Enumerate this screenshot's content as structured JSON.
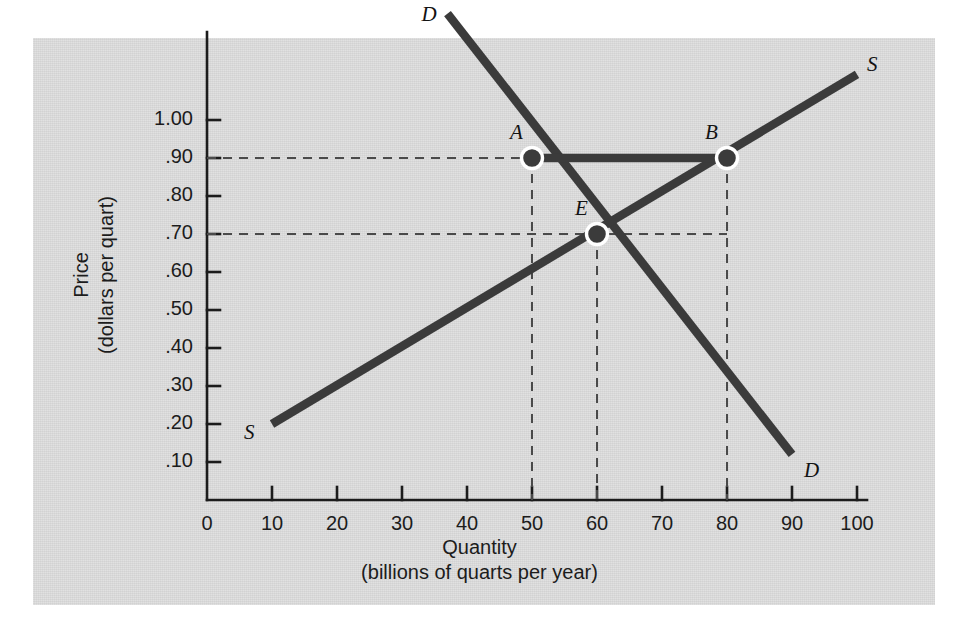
{
  "chart_data": {
    "type": "line",
    "title": "",
    "xlabel": "Quantity\n(billions of quarts per year)",
    "xlabel_main": "Quantity",
    "xlabel_sub": "(billions of quarts per year)",
    "ylabel": "Price\n(dollars per quart)",
    "ylabel_main": "Price",
    "ylabel_sub": "(dollars per quart)",
    "xlim": [
      0,
      100
    ],
    "ylim": [
      0,
      1.2
    ],
    "grid": false,
    "legend": "none",
    "x_ticks": [
      "0",
      "10",
      "20",
      "30",
      "40",
      "50",
      "60",
      "70",
      "80",
      "90",
      "100"
    ],
    "x_tick_values": [
      0,
      10,
      20,
      30,
      40,
      50,
      60,
      70,
      80,
      90,
      100
    ],
    "y_ticks": [
      ".10",
      ".20",
      ".30",
      ".40",
      ".50",
      ".60",
      ".70",
      ".80",
      ".90",
      "1.00"
    ],
    "y_tick_values": [
      0.1,
      0.2,
      0.3,
      0.4,
      0.5,
      0.6,
      0.7,
      0.8,
      0.9,
      1.0
    ],
    "series": [
      {
        "name": "Demand",
        "label": "D",
        "label_start": "D",
        "label_end": "D",
        "points": [
          [
            37,
            1.28
          ],
          [
            90,
            0.12
          ]
        ],
        "color": "#3b3b3b"
      },
      {
        "name": "Supply",
        "label": "S",
        "label_start": "S",
        "label_end": "S",
        "points": [
          [
            10,
            0.2
          ],
          [
            100,
            1.12
          ]
        ],
        "color": "#3b3b3b"
      }
    ],
    "annotated_points": [
      {
        "label": "A",
        "x": 50,
        "y": 0.9,
        "note": "quantity demanded at price .90"
      },
      {
        "label": "E",
        "x": 60,
        "y": 0.7,
        "note": "equilibrium"
      },
      {
        "label": "B",
        "x": 80,
        "y": 0.9,
        "note": "quantity supplied at price .90"
      }
    ],
    "surplus_bar": {
      "from_label": "A",
      "to_label": "B",
      "y": 0.9,
      "x_from": 50,
      "x_to": 80
    },
    "guide_lines": {
      "horizontal_at": [
        0.9,
        0.7
      ],
      "vertical_at": [
        50,
        60,
        80
      ]
    }
  },
  "colors": {
    "panel_background": "#d6d6d6",
    "page_background": "#ffffff",
    "curve": "#3b3b3b",
    "axis": "#1c1c1c",
    "marker_fill": "#3b3b3b",
    "marker_ring": "#ffffff",
    "dash": "#4a4a4a",
    "text": "#1c1c1c"
  }
}
